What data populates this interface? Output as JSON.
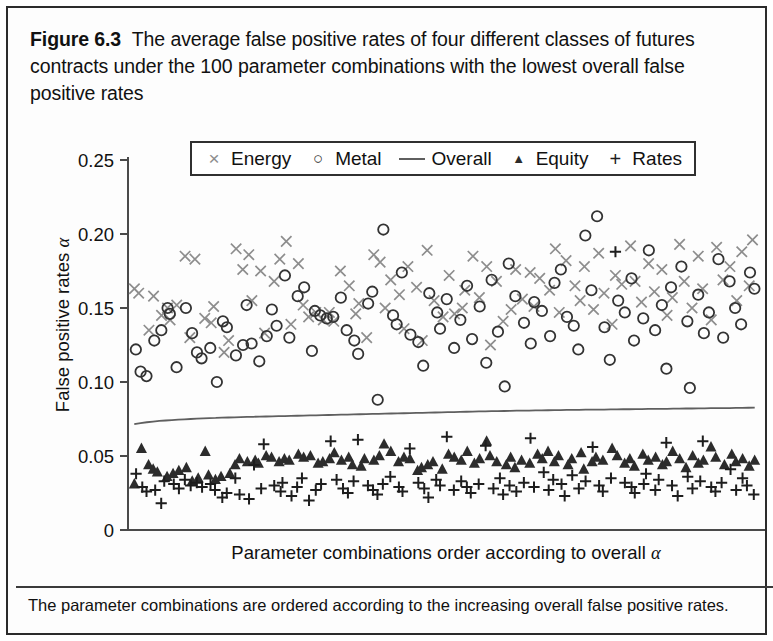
{
  "figure": {
    "label": "Figure 6.3",
    "title": "The average false positive rates of four different classes of futures contracts under the 100 parameter combinations with the lowest overall false positive rates",
    "caption": "The parameter combinations are ordered according to the increasing overall false positive rates."
  },
  "legend": {
    "items": [
      {
        "symbol": "×",
        "label": "Energy",
        "color": "#8d8d8d",
        "type": "cross"
      },
      {
        "symbol": "○",
        "label": "Metal",
        "color": "#333333",
        "type": "circle"
      },
      {
        "symbol": "—",
        "label": "Overall",
        "color": "#5f5f5f",
        "type": "line"
      },
      {
        "symbol": "▲",
        "label": "Equity",
        "color": "#2c2c2c",
        "type": "triangle"
      },
      {
        "symbol": "+",
        "label": "Rates",
        "color": "#1d1d1d",
        "type": "plus"
      }
    ]
  },
  "axes": {
    "y_ticks": [
      "0",
      "0.05",
      "0.10",
      "0.15",
      "0.20",
      "0.25"
    ],
    "y_tick_values": [
      0,
      0.05,
      0.1,
      0.15,
      0.2,
      0.25
    ],
    "ylabel_text": "False positive rates ",
    "ylabel_symbol": "α",
    "xlabel_text": "Parameter combinations order according to overall ",
    "xlabel_symbol": "α"
  },
  "chart_data": {
    "type": "scatter",
    "title": "The average false positive rates of four different classes of futures contracts under the 100 parameter combinations with the lowest overall false positive rates",
    "xlabel": "Parameter combinations order according to overall α",
    "ylabel": "False positive rates α",
    "xlim": [
      0,
      101
    ],
    "ylim": [
      0,
      0.25
    ],
    "grid": false,
    "legend_position": "top-center-outside",
    "x": [
      1,
      2,
      3,
      4,
      5,
      6,
      7,
      8,
      9,
      10,
      11,
      12,
      13,
      14,
      15,
      16,
      17,
      18,
      19,
      20,
      21,
      22,
      23,
      24,
      25,
      26,
      27,
      28,
      29,
      30,
      31,
      32,
      33,
      34,
      35,
      36,
      37,
      38,
      39,
      40,
      41,
      42,
      43,
      44,
      45,
      46,
      47,
      48,
      49,
      50,
      51,
      52,
      53,
      54,
      55,
      56,
      57,
      58,
      59,
      60,
      61,
      62,
      63,
      64,
      65,
      66,
      67,
      68,
      69,
      70,
      71,
      72,
      73,
      74,
      75,
      76,
      77,
      78,
      79,
      80,
      81,
      82,
      83,
      84,
      85,
      86,
      87,
      88,
      89,
      90,
      91,
      92,
      93,
      94,
      95,
      96,
      97,
      98,
      99,
      100
    ],
    "series": [
      {
        "name": "Energy",
        "marker": "x",
        "color": "#8d8d8d",
        "values": [
          0.163,
          0.16,
          0.135,
          0.158,
          0.145,
          0.15,
          0.142,
          0.152,
          0.185,
          0.13,
          0.183,
          0.143,
          0.14,
          0.151,
          0.12,
          0.128,
          0.19,
          0.176,
          0.186,
          0.155,
          0.175,
          0.133,
          0.168,
          0.183,
          0.195,
          0.139,
          0.18,
          0.152,
          0.144,
          0.147,
          0.142,
          0.147,
          0.141,
          0.175,
          0.165,
          0.146,
          0.153,
          0.13,
          0.186,
          0.181,
          0.15,
          0.169,
          0.159,
          0.136,
          0.178,
          0.164,
          0.128,
          0.189,
          0.155,
          0.144,
          0.172,
          0.146,
          0.15,
          0.162,
          0.185,
          0.157,
          0.178,
          0.125,
          0.168,
          0.141,
          0.149,
          0.176,
          0.156,
          0.174,
          0.151,
          0.17,
          0.162,
          0.19,
          0.147,
          0.182,
          0.165,
          0.155,
          0.178,
          0.149,
          0.187,
          0.16,
          0.139,
          0.172,
          0.166,
          0.192,
          0.168,
          0.154,
          0.18,
          0.161,
          0.176,
          0.145,
          0.157,
          0.193,
          0.168,
          0.15,
          0.185,
          0.163,
          0.142,
          0.191,
          0.169,
          0.178,
          0.155,
          0.188,
          0.165,
          0.196
        ]
      },
      {
        "name": "Metal",
        "marker": "o",
        "color": "#333333",
        "values": [
          0.122,
          0.107,
          0.104,
          0.128,
          0.135,
          0.15,
          0.146,
          0.11,
          0.15,
          0.133,
          0.12,
          0.116,
          0.123,
          0.1,
          0.141,
          0.137,
          0.118,
          0.125,
          0.152,
          0.126,
          0.114,
          0.131,
          0.149,
          0.138,
          0.172,
          0.13,
          0.158,
          0.164,
          0.121,
          0.148,
          0.145,
          0.143,
          0.144,
          0.157,
          0.135,
          0.128,
          0.119,
          0.153,
          0.161,
          0.088,
          0.203,
          0.145,
          0.139,
          0.174,
          0.132,
          0.127,
          0.111,
          0.16,
          0.147,
          0.136,
          0.156,
          0.123,
          0.142,
          0.165,
          0.129,
          0.151,
          0.113,
          0.169,
          0.134,
          0.097,
          0.18,
          0.158,
          0.14,
          0.126,
          0.154,
          0.148,
          0.131,
          0.167,
          0.176,
          0.144,
          0.138,
          0.122,
          0.199,
          0.162,
          0.212,
          0.137,
          0.115,
          0.155,
          0.147,
          0.17,
          0.128,
          0.143,
          0.189,
          0.135,
          0.152,
          0.109,
          0.164,
          0.178,
          0.141,
          0.096,
          0.159,
          0.133,
          0.147,
          0.183,
          0.13,
          0.168,
          0.15,
          0.139,
          0.174,
          0.163
        ]
      },
      {
        "name": "Overall",
        "marker": "line",
        "color": "#5f5f5f",
        "values": [
          0.0715,
          0.0722,
          0.0728,
          0.0733,
          0.0737,
          0.074,
          0.0743,
          0.0746,
          0.0748,
          0.075,
          0.0752,
          0.0754,
          0.0756,
          0.0757,
          0.0759,
          0.076,
          0.0761,
          0.0763,
          0.0764,
          0.0765,
          0.0766,
          0.0767,
          0.0768,
          0.0769,
          0.077,
          0.0771,
          0.0772,
          0.0773,
          0.0774,
          0.0775,
          0.0776,
          0.0777,
          0.0778,
          0.0779,
          0.078,
          0.0781,
          0.0782,
          0.0783,
          0.0784,
          0.0785,
          0.0786,
          0.0787,
          0.0788,
          0.0789,
          0.079,
          0.0791,
          0.0792,
          0.0793,
          0.0794,
          0.0795,
          0.0796,
          0.0797,
          0.0798,
          0.0799,
          0.08,
          0.0801,
          0.0802,
          0.0803,
          0.0803,
          0.0804,
          0.0805,
          0.0806,
          0.0806,
          0.0807,
          0.0808,
          0.0808,
          0.0809,
          0.081,
          0.081,
          0.0811,
          0.0812,
          0.0812,
          0.0813,
          0.0813,
          0.0814,
          0.0814,
          0.0815,
          0.0815,
          0.0816,
          0.0816,
          0.0817,
          0.0817,
          0.0818,
          0.0818,
          0.0819,
          0.0819,
          0.082,
          0.082,
          0.0821,
          0.0821,
          0.0822,
          0.0822,
          0.0823,
          0.0823,
          0.0824,
          0.0824,
          0.0825,
          0.0825,
          0.0826,
          0.0827
        ]
      },
      {
        "name": "Equity",
        "marker": "triangle",
        "color": "#2c2c2c",
        "values": [
          0.031,
          0.055,
          0.044,
          0.041,
          0.039,
          0.036,
          0.038,
          0.04,
          0.042,
          0.033,
          0.035,
          0.053,
          0.037,
          0.034,
          0.036,
          0.038,
          0.044,
          0.048,
          0.046,
          0.047,
          0.045,
          0.05,
          0.049,
          0.046,
          0.048,
          0.047,
          0.051,
          0.049,
          0.05,
          0.045,
          0.046,
          0.048,
          0.052,
          0.047,
          0.049,
          0.044,
          0.043,
          0.048,
          0.047,
          0.05,
          0.058,
          0.053,
          0.046,
          0.049,
          0.048,
          0.04,
          0.042,
          0.044,
          0.046,
          0.041,
          0.051,
          0.049,
          0.047,
          0.053,
          0.045,
          0.048,
          0.06,
          0.05,
          0.046,
          0.044,
          0.049,
          0.042,
          0.047,
          0.045,
          0.051,
          0.048,
          0.053,
          0.046,
          0.05,
          0.044,
          0.048,
          0.052,
          0.041,
          0.046,
          0.049,
          0.047,
          0.055,
          0.05,
          0.045,
          0.048,
          0.043,
          0.051,
          0.047,
          0.049,
          0.044,
          0.046,
          0.053,
          0.048,
          0.042,
          0.05,
          0.045,
          0.047,
          0.056,
          0.049,
          0.044,
          0.051,
          0.046,
          0.048,
          0.043,
          0.047
        ]
      },
      {
        "name": "Rates",
        "marker": "plus",
        "color": "#1d1d1d",
        "values": [
          0.038,
          0.029,
          0.026,
          0.027,
          0.018,
          0.033,
          0.031,
          0.028,
          0.034,
          0.03,
          0.032,
          0.029,
          0.031,
          0.027,
          0.022,
          0.025,
          0.035,
          0.024,
          0.021,
          0.044,
          0.028,
          0.058,
          0.03,
          0.026,
          0.032,
          0.023,
          0.029,
          0.035,
          0.02,
          0.027,
          0.031,
          0.06,
          0.034,
          0.028,
          0.025,
          0.033,
          0.061,
          0.03,
          0.027,
          0.024,
          0.031,
          0.036,
          0.029,
          0.026,
          0.055,
          0.032,
          0.028,
          0.022,
          0.034,
          0.03,
          0.063,
          0.027,
          0.033,
          0.029,
          0.025,
          0.031,
          0.057,
          0.028,
          0.035,
          0.024,
          0.03,
          0.026,
          0.032,
          0.062,
          0.029,
          0.039,
          0.027,
          0.034,
          0.031,
          0.023,
          0.037,
          0.028,
          0.033,
          0.056,
          0.03,
          0.026,
          0.035,
          0.188,
          0.032,
          0.029,
          0.025,
          0.031,
          0.038,
          0.027,
          0.034,
          0.059,
          0.03,
          0.023,
          0.036,
          0.028,
          0.033,
          0.06,
          0.029,
          0.026,
          0.032,
          0.041,
          0.027,
          0.035,
          0.03,
          0.024
        ]
      }
    ]
  }
}
